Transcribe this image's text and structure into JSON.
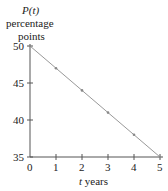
{
  "chart_data": {
    "type": "line",
    "title": "",
    "ylabel_lines": [
      "P(t)",
      "percentage",
      "points"
    ],
    "xlabel": "t years",
    "x": [
      0,
      1,
      2,
      3,
      4,
      5
    ],
    "series": [
      {
        "name": "P(t)",
        "values": [
          50,
          47,
          44,
          41,
          38,
          35
        ]
      }
    ],
    "xticks": [
      "0",
      "1",
      "2",
      "3",
      "4",
      "5"
    ],
    "yticks": [
      "35",
      "40",
      "45",
      "50"
    ],
    "xlim": [
      0,
      5
    ],
    "ylim": [
      35,
      50
    ],
    "grid": false,
    "line_color": "#999999",
    "marker_color": "#888888"
  }
}
